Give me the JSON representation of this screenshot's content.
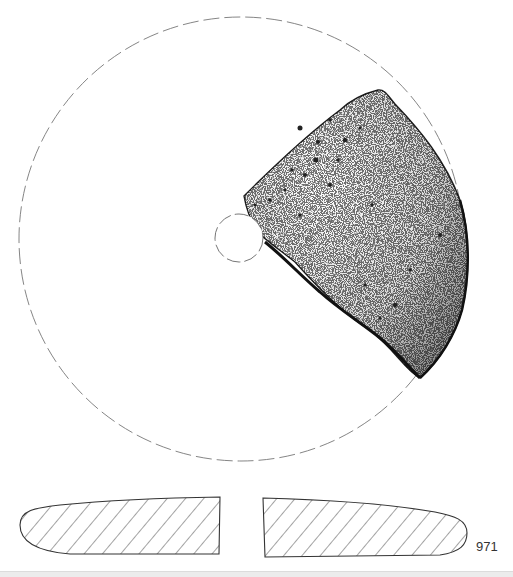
{
  "figure": {
    "catalog_number": "971",
    "plan_view": {
      "outer_circle": {
        "cx": 241,
        "cy": 239,
        "r": 222,
        "style": "dashed"
      },
      "central_hole": {
        "cx": 239,
        "cy": 238,
        "r": 24,
        "style": "dashed"
      }
    },
    "section_view": {
      "left_profile": "hatched cross-section",
      "right_profile": "hatched cross-section"
    },
    "colors": {
      "line": "#333333",
      "dashed": "#777777",
      "stipple": "#222222",
      "band": "#ececec"
    }
  }
}
